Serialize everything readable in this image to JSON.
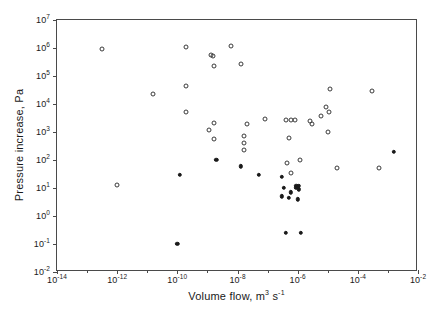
{
  "chart_data": {
    "type": "scatter",
    "title": "",
    "xlabel": "Volume flow, m3 s-1",
    "ylabel": "Pressure increase, Pa",
    "xlabel_parts": {
      "text": "Volume flow, m",
      "sup1": "3",
      "mid": " s",
      "sup2": "-1"
    },
    "xscale": "log",
    "yscale": "log",
    "xlim": [
      1e-14,
      0.01
    ],
    "ylim": [
      0.01,
      10000000.0
    ],
    "grid": false,
    "legend": null,
    "xticks": [
      {
        "value": 1e-14,
        "label_base": "10",
        "label_exp": "-14",
        "major": true
      },
      {
        "value": 1e-13,
        "label_base": "",
        "label_exp": "",
        "major": false
      },
      {
        "value": 1e-12,
        "label_base": "10",
        "label_exp": "-12",
        "major": true
      },
      {
        "value": 1e-11,
        "label_base": "",
        "label_exp": "",
        "major": false
      },
      {
        "value": 1e-10,
        "label_base": "10",
        "label_exp": "-10",
        "major": true
      },
      {
        "value": 1e-09,
        "label_base": "",
        "label_exp": "",
        "major": false
      },
      {
        "value": 1e-08,
        "label_base": "10",
        "label_exp": "-8",
        "major": true
      },
      {
        "value": 1e-07,
        "label_base": "",
        "label_exp": "",
        "major": false
      },
      {
        "value": 1e-06,
        "label_base": "10",
        "label_exp": "-6",
        "major": true
      },
      {
        "value": 1e-05,
        "label_base": "",
        "label_exp": "",
        "major": false
      },
      {
        "value": 0.0001,
        "label_base": "10",
        "label_exp": "-4",
        "major": true
      },
      {
        "value": 0.001,
        "label_base": "",
        "label_exp": "",
        "major": false
      },
      {
        "value": 0.01,
        "label_base": "10",
        "label_exp": "-2",
        "major": true
      }
    ],
    "yticks": [
      {
        "value": 0.01,
        "label_base": "10",
        "label_exp": "-2"
      },
      {
        "value": 0.1,
        "label_base": "10",
        "label_exp": "-1"
      },
      {
        "value": 1.0,
        "label_base": "10",
        "label_exp": "0"
      },
      {
        "value": 10.0,
        "label_base": "10",
        "label_exp": "1"
      },
      {
        "value": 100.0,
        "label_base": "10",
        "label_exp": "2"
      },
      {
        "value": 1000.0,
        "label_base": "10",
        "label_exp": "3"
      },
      {
        "value": 10000.0,
        "label_base": "10",
        "label_exp": "4"
      },
      {
        "value": 100000.0,
        "label_base": "10",
        "label_exp": "5"
      },
      {
        "value": 1000000.0,
        "label_base": "10",
        "label_exp": "6"
      },
      {
        "value": 10000000.0,
        "label_base": "10",
        "label_exp": "7"
      }
    ],
    "series": [
      {
        "name": "open-markers",
        "marker": "open-circle",
        "color": "#3a3a3a",
        "points": [
          {
            "x": 3.2e-13,
            "y": 900000.0
          },
          {
            "x": 1e-12,
            "y": 13.0
          },
          {
            "x": 1.6e-11,
            "y": 22000.0
          },
          {
            "x": 2e-10,
            "y": 1100000.0
          },
          {
            "x": 2e-10,
            "y": 5000.0
          },
          {
            "x": 2e-10,
            "y": 45000.0
          },
          {
            "x": 1.3e-09,
            "y": 550000.0
          },
          {
            "x": 1.5e-09,
            "y": 500000.0
          },
          {
            "x": 1.6e-09,
            "y": 230000.0
          },
          {
            "x": 1.1e-09,
            "y": 1200.0
          },
          {
            "x": 1.7e-09,
            "y": 2100.0
          },
          {
            "x": 1.6e-09,
            "y": 550.0
          },
          {
            "x": 6e-09,
            "y": 1200000.0
          },
          {
            "x": 1.3e-08,
            "y": 260000.0
          },
          {
            "x": 2e-08,
            "y": 2000.0
          },
          {
            "x": 1.6e-08,
            "y": 700.0
          },
          {
            "x": 1.6e-08,
            "y": 400.0
          },
          {
            "x": 1.7e-08,
            "y": 220.0
          },
          {
            "x": 8e-08,
            "y": 3000.0
          },
          {
            "x": 4e-07,
            "y": 2600.0
          },
          {
            "x": 6e-07,
            "y": 2600.0
          },
          {
            "x": 8e-07,
            "y": 2600.0
          },
          {
            "x": 5e-07,
            "y": 600.0
          },
          {
            "x": 6e-07,
            "y": 35.0
          },
          {
            "x": 4.5e-07,
            "y": 80.0
          },
          {
            "x": 1.2e-06,
            "y": 100.0
          },
          {
            "x": 2.5e-06,
            "y": 2500.0
          },
          {
            "x": 3e-06,
            "y": 2000.0
          },
          {
            "x": 6e-06,
            "y": 3600.0
          },
          {
            "x": 9e-06,
            "y": 8000.0
          },
          {
            "x": 1.2e-05,
            "y": 35000.0
          },
          {
            "x": 1.1e-05,
            "y": 5000.0
          },
          {
            "x": 1e-05,
            "y": 1000.0
          },
          {
            "x": 2e-05,
            "y": 50.0
          },
          {
            "x": 0.0003,
            "y": 30000.0
          },
          {
            "x": 0.0005,
            "y": 50.0
          }
        ]
      },
      {
        "name": "filled-markers",
        "marker": "filled-circle",
        "color": "#1a1a1a",
        "points": [
          {
            "x": 1e-10,
            "y": 0.1
          },
          {
            "x": 1.2e-10,
            "y": 30.0
          },
          {
            "x": 2e-09,
            "y": 100.0
          },
          {
            "x": 1.3e-08,
            "y": 60.0
          },
          {
            "x": 5e-08,
            "y": 30.0
          },
          {
            "x": 3e-07,
            "y": 25.0
          },
          {
            "x": 3.5e-07,
            "y": 10.0
          },
          {
            "x": 3e-07,
            "y": 5.0
          },
          {
            "x": 6e-07,
            "y": 7.0
          },
          {
            "x": 5e-07,
            "y": 4.5
          },
          {
            "x": 9e-07,
            "y": 12.0
          },
          {
            "x": 1.1e-06,
            "y": 12.0
          },
          {
            "x": 9e-07,
            "y": 10.0
          },
          {
            "x": 1.1e-06,
            "y": 9.0
          },
          {
            "x": 1e-06,
            "y": 4.0
          },
          {
            "x": 4e-07,
            "y": 0.25
          },
          {
            "x": 1.3e-06,
            "y": 0.25
          },
          {
            "x": 0.0016,
            "y": 200.0
          }
        ]
      }
    ]
  }
}
